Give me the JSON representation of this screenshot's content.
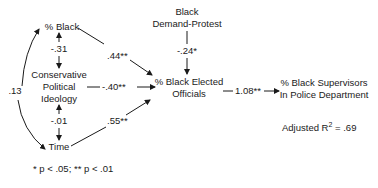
{
  "diagram": {
    "type": "path-diagram",
    "nodes": {
      "pct_black": "% Black",
      "ideology_1": "Conservative",
      "ideology_2": "Political",
      "ideology_3": "Ideology",
      "time": "Time",
      "protest_1": "Black",
      "protest_2": "Demand-Protest",
      "elected_1": "% Black Elected",
      "elected_2": "Officials",
      "supervisors_1": "% Black Supervisors",
      "supervisors_2": "In Police Department"
    },
    "coefficients": {
      "black_ideology": "-.31",
      "ideology_time": "-.01",
      "black_time": ".13",
      "black_elected": ".44**",
      "ideology_elected": "-.40**",
      "time_elected": ".55**",
      "protest_elected": "-.24*",
      "elected_supervisors": "1.08**"
    },
    "r_squared_label": "Adjusted R",
    "r_squared_sup": "2",
    "r_squared_value": " = .69",
    "footnote": "* p < .05; ** p < .01"
  }
}
